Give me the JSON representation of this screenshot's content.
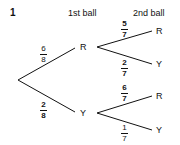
{
  "question_number": "1",
  "headers": {
    "first": "1st ball",
    "second": "2nd ball"
  },
  "tree": {
    "first_level": [
      {
        "outcome": "R",
        "probability": {
          "num": "6",
          "den": "8"
        }
      },
      {
        "outcome": "Y",
        "probability": {
          "num": "2",
          "den": "8"
        }
      }
    ],
    "second_level": {
      "after_R": [
        {
          "outcome": "R",
          "probability": {
            "num": "5",
            "den": "7"
          }
        },
        {
          "outcome": "Y",
          "probability": {
            "num": "2",
            "den": "7"
          }
        }
      ],
      "after_Y": [
        {
          "outcome": "R",
          "probability": {
            "num": "6",
            "den": "7"
          }
        },
        {
          "outcome": "Y",
          "probability": {
            "num": "1",
            "den": "7"
          }
        }
      ]
    }
  }
}
